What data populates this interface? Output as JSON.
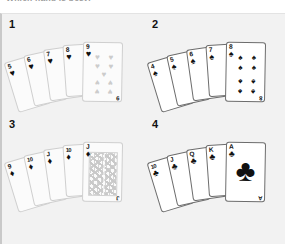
{
  "caption": {
    "text": "Which hand is best?"
  },
  "figure": {
    "background_color": "#f2f2f2",
    "hands": [
      {
        "number": "1",
        "suit_name": "hearts",
        "suit_symbol": "♥",
        "color": "#cccccc",
        "style": "faded",
        "hand_type": "flush",
        "cards": [
          {
            "rank": "5",
            "suit_symbol": "♥"
          },
          {
            "rank": "6",
            "suit_symbol": "♥"
          },
          {
            "rank": "7",
            "suit_symbol": "♥"
          },
          {
            "rank": "8",
            "suit_symbol": "♥"
          },
          {
            "rank": "9",
            "suit_symbol": "♥"
          }
        ],
        "exposed_card": {
          "rank": "9",
          "suit_symbol": "♥",
          "pip_count": 9
        }
      },
      {
        "number": "2",
        "suit_name": "spades",
        "suit_symbol": "♠",
        "color": "#111111",
        "style": "solid",
        "hand_type": "straight flush",
        "cards": [
          {
            "rank": "4",
            "suit_symbol": "♠"
          },
          {
            "rank": "5",
            "suit_symbol": "♠"
          },
          {
            "rank": "6",
            "suit_symbol": "♠"
          },
          {
            "rank": "7",
            "suit_symbol": "♠"
          },
          {
            "rank": "8",
            "suit_symbol": "♠"
          }
        ],
        "exposed_card": {
          "rank": "8",
          "suit_symbol": "♠",
          "pip_count": 8
        }
      },
      {
        "number": "3",
        "suit_name": "diamonds",
        "suit_symbol": "♦",
        "color": "#cccccc",
        "style": "faded",
        "hand_type": "royal flush",
        "cards": [
          {
            "rank": "9",
            "suit_symbol": "♦"
          },
          {
            "rank": "10",
            "suit_symbol": "♦"
          },
          {
            "rank": "J",
            "suit_symbol": "♦"
          },
          {
            "rank": "10",
            "suit_symbol": "♦"
          },
          {
            "rank": "J",
            "suit_symbol": "♦"
          }
        ],
        "exposed_card": {
          "rank": "J",
          "suit_symbol": "♦",
          "is_court": true
        }
      },
      {
        "number": "4",
        "suit_name": "clubs",
        "suit_symbol": "♣",
        "color": "#111111",
        "style": "solid",
        "hand_type": "royal flush",
        "cards": [
          {
            "rank": "10",
            "suit_symbol": "♣"
          },
          {
            "rank": "J",
            "suit_symbol": "♣"
          },
          {
            "rank": "Q",
            "suit_symbol": "♣"
          },
          {
            "rank": "K",
            "suit_symbol": "♣"
          },
          {
            "rank": "A",
            "suit_symbol": "♣"
          }
        ],
        "exposed_card": {
          "rank": "A",
          "suit_symbol": "♣",
          "is_ace": true
        }
      }
    ]
  }
}
